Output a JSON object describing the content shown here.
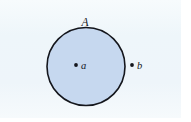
{
  "figure": {
    "caption_text": "",
    "background_color": "#fbfdfe",
    "panel_tint_color": "#eef5fa",
    "ink_color": "#14161c",
    "disk": {
      "label": "A",
      "fill_color": "#c6d8ef",
      "stroke_color": "#14161c",
      "center_x": 86,
      "center_y": 66.5,
      "radius": 39
    },
    "points": [
      {
        "label": "a",
        "position": "interior",
        "dot_x": 76,
        "dot_y": 65,
        "label_x": 81,
        "label_y": 69
      },
      {
        "label": "b",
        "position": "exterior",
        "dot_x": 132,
        "dot_y": 65,
        "label_x": 137,
        "label_y": 69
      }
    ],
    "label_A_x": 85,
    "label_A_y": 26
  }
}
